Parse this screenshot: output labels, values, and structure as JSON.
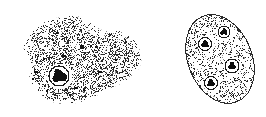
{
  "figure": {
    "type": "scientific-line-illustration",
    "domain": "microscopy-diagram",
    "caption": "",
    "background_color": "#ffffff",
    "ink_color": "#1a1a1a",
    "width": 266,
    "height": 117,
    "panel_count": 2,
    "panels": [
      {
        "id": "trophozoite",
        "name": "amoeboid-trophozoite",
        "label": "",
        "outline_style": "none-soft-stippled-edge",
        "fill_style": "dense-random-stipple",
        "stipple_density": 0.34,
        "stipple_dot_size": 1,
        "bounds": {
          "x": 14,
          "y": 8,
          "width": 134,
          "height": 100
        },
        "body_shape": "irregular-amoeboid-with-posterior-pseudopod",
        "outline_points": [
          [
            30,
            62
          ],
          [
            24,
            50
          ],
          [
            26,
            38
          ],
          [
            36,
            27
          ],
          [
            50,
            20
          ],
          [
            66,
            16
          ],
          [
            80,
            17
          ],
          [
            92,
            24
          ],
          [
            102,
            30
          ],
          [
            114,
            30
          ],
          [
            126,
            33
          ],
          [
            136,
            42
          ],
          [
            141,
            54
          ],
          [
            140,
            66
          ],
          [
            132,
            76
          ],
          [
            120,
            84
          ],
          [
            106,
            90
          ],
          [
            96,
            96
          ],
          [
            84,
            101
          ],
          [
            70,
            104
          ],
          [
            56,
            103
          ],
          [
            44,
            97
          ],
          [
            34,
            87
          ],
          [
            29,
            75
          ]
        ],
        "nucleus": {
          "name": "nucleus",
          "center": [
            59,
            76
          ],
          "halo_radius": 11.5,
          "halo_color": "#ffffff",
          "ring_radius": 10,
          "ring_color": "#1a1a1a",
          "karyosome_radius": 6.5,
          "karyosome_color": "#111111",
          "karyosome_shape": "irregular-lobed-blob"
        },
        "granules": [
          {
            "x": 82,
            "y": 47,
            "w": 5,
            "h": 4
          },
          {
            "x": 91,
            "y": 46,
            "w": 3,
            "h": 3
          },
          {
            "x": 96,
            "y": 47,
            "w": 3,
            "h": 2
          },
          {
            "x": 64,
            "y": 56,
            "w": 4,
            "h": 3
          },
          {
            "x": 44,
            "y": 59,
            "w": 3,
            "h": 2
          },
          {
            "x": 36,
            "y": 72,
            "w": 4,
            "h": 3
          },
          {
            "x": 33,
            "y": 79,
            "w": 3,
            "h": 2
          },
          {
            "x": 76,
            "y": 88,
            "w": 4,
            "h": 3
          },
          {
            "x": 84,
            "y": 90,
            "w": 3,
            "h": 3
          },
          {
            "x": 100,
            "y": 72,
            "w": 4,
            "h": 3
          },
          {
            "x": 108,
            "y": 75,
            "w": 3,
            "h": 2
          },
          {
            "x": 57,
            "y": 33,
            "w": 3,
            "h": 2
          },
          {
            "x": 70,
            "y": 95,
            "w": 3,
            "h": 2
          },
          {
            "x": 47,
            "y": 91,
            "w": 3,
            "h": 2
          },
          {
            "x": 116,
            "y": 60,
            "w": 3,
            "h": 2
          }
        ]
      },
      {
        "id": "cyst",
        "name": "quadrinucleate-cyst",
        "label": "",
        "outline_style": "single-thin-continuous-line",
        "outline_color": "#2b2b2b",
        "outline_width": 1,
        "fill_style": "fine-even-stipple",
        "stipple_density": 0.2,
        "stipple_dot_size": 1,
        "bounds": {
          "x": 186,
          "y": 12,
          "width": 68,
          "height": 94
        },
        "body_shape": "tilted-ellipse",
        "ellipse": {
          "cx": 220,
          "cy": 59,
          "rx": 32,
          "ry": 46,
          "rotation_deg": -22
        },
        "nucleus_count": 4,
        "nuclei": [
          {
            "name": "nucleus-1",
            "center": [
              224,
              32
            ],
            "halo_radius": 7,
            "ring_radius": 6,
            "karyosome_radius": 3.4
          },
          {
            "name": "nucleus-2",
            "center": [
              205,
              44
            ],
            "halo_radius": 7.5,
            "ring_radius": 6.5,
            "karyosome_radius": 3.6
          },
          {
            "name": "nucleus-3",
            "center": [
              232,
              66
            ],
            "halo_radius": 8,
            "ring_radius": 7,
            "karyosome_radius": 3.8
          },
          {
            "name": "nucleus-4",
            "center": [
              211,
              83
            ],
            "halo_radius": 7.5,
            "ring_radius": 6.5,
            "karyosome_radius": 3.6
          }
        ],
        "nucleus_ring_color": "#1a1a1a",
        "nucleus_halo_color": "#ffffff",
        "nucleus_karyosome_color": "#0d0d0d"
      }
    ]
  }
}
